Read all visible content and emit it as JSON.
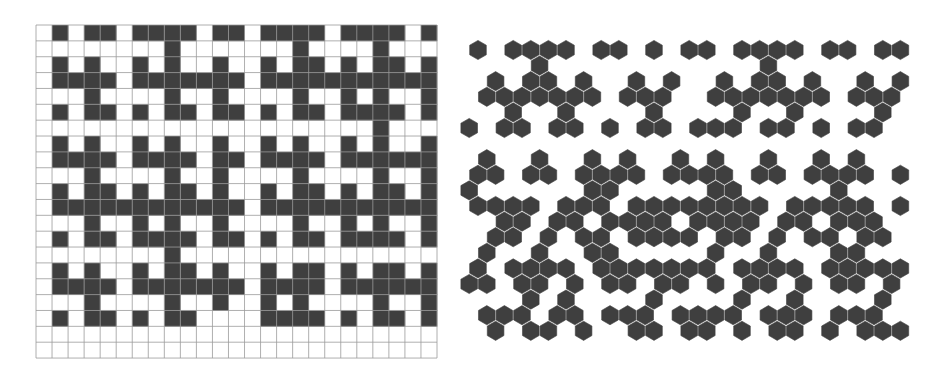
{
  "figure": {
    "background": "#ffffff",
    "fill_color": "#3f3f3f",
    "grid_line_color": "#9a9a9a",
    "panels": [
      {
        "id": "square-tiling",
        "type": "square-grid",
        "origin": [
          36,
          25
        ],
        "cell_width": 16.04,
        "cell_height": 15.86,
        "cols": 25,
        "rows": [
          "0101101111011011110111101",
          "0000000010000000100001000",
          "0101001010010010110101101",
          "0111101111111011111111111",
          "0001000010010000100101001",
          "0101101011011010110111101",
          "0000000000000000000001000",
          "0101001010010010100101001",
          "0111101111011011110111111",
          "0001000010010000100001001",
          "0101101011010010110101101",
          "0111111111111011111111111",
          "0001001010010000100101001",
          "0101101111011010110111101",
          "0000000010000000000000000",
          "0101001011010010110101101",
          "0111101111111011110111111",
          "0001000010010010100001001",
          "0101101011000011110101101",
          "0000000000000000000000000",
          "0000000000000000000000000"
        ]
      },
      {
        "id": "hex-tiling",
        "type": "hex-grid",
        "origin": [
          478,
          50
        ],
        "col_spacing": 17.6,
        "row_spacing": 15.6,
        "hex_radius": 9.6,
        "rows": [
          [
            0,
            2,
            3,
            4,
            5,
            7,
            8,
            10,
            12,
            13,
            15,
            16,
            17,
            18,
            20,
            21,
            23,
            24
          ],
          [
            3,
            16
          ],
          [
            1,
            3,
            4,
            6,
            9,
            11,
            14,
            16,
            17,
            19,
            22,
            24
          ],
          [
            0,
            1,
            2,
            3,
            4,
            5,
            6,
            8,
            9,
            10,
            13,
            14,
            15,
            16,
            17,
            18,
            19,
            21,
            22,
            23
          ],
          [
            2,
            5,
            10,
            15,
            18,
            23
          ],
          [
            -1,
            1,
            2,
            4,
            5,
            7,
            9,
            10,
            12,
            13,
            14,
            16,
            17,
            19,
            21,
            22
          ],
          [],
          [
            0,
            3,
            6,
            8,
            11,
            13,
            16,
            19,
            21
          ],
          [
            0,
            1,
            3,
            4,
            6,
            7,
            8,
            9,
            11,
            12,
            13,
            14,
            16,
            17,
            19,
            20,
            21,
            22,
            24
          ],
          [
            -1,
            6,
            7,
            13,
            14,
            20
          ],
          [
            0,
            1,
            2,
            3,
            5,
            6,
            7,
            9,
            10,
            11,
            12,
            13,
            14,
            15,
            16,
            18,
            19,
            20,
            21,
            22,
            24
          ],
          [
            1,
            2,
            4,
            5,
            7,
            8,
            9,
            10,
            12,
            13,
            14,
            15,
            17,
            18,
            20,
            21,
            22
          ],
          [
            1,
            2,
            4,
            6,
            7,
            9,
            10,
            11,
            12,
            14,
            15,
            17,
            19,
            20,
            22,
            23
          ],
          [
            0,
            3,
            6,
            7,
            13,
            16,
            20,
            21
          ],
          [
            0,
            2,
            3,
            4,
            5,
            7,
            8,
            9,
            10,
            11,
            12,
            13,
            15,
            16,
            17,
            18,
            20,
            21,
            22,
            23,
            24
          ],
          [
            -1,
            0,
            2,
            3,
            5,
            7,
            8,
            10,
            11,
            13,
            15,
            16,
            18,
            20,
            21,
            23
          ],
          [
            3,
            5,
            10,
            15,
            18,
            23
          ],
          [
            0,
            1,
            2,
            4,
            5,
            7,
            8,
            9,
            11,
            12,
            13,
            14,
            16,
            17,
            18,
            20,
            21,
            22
          ],
          [
            1,
            3,
            4,
            6,
            9,
            10,
            12,
            13,
            15,
            17,
            18,
            20,
            22,
            23,
            24
          ]
        ]
      }
    ]
  }
}
